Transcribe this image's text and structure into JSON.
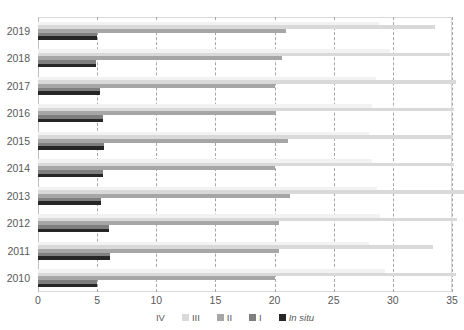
{
  "chart_data": {
    "type": "bar",
    "orientation": "horizontal",
    "title": "",
    "subtitle": "",
    "xlabel": "",
    "ylabel": "",
    "xlim": [
      0,
      35
    ],
    "ylim": null,
    "grid": true,
    "grid_axis": "x",
    "legend_position": "bottom",
    "categories": [
      "2019",
      "2018",
      "2017",
      "2016",
      "2015",
      "2014",
      "2013",
      "2012",
      "2011",
      "2010"
    ],
    "xticks": [
      0,
      5,
      10,
      15,
      20,
      25,
      30,
      35
    ],
    "xtick_labels": [
      "0",
      "5",
      "10",
      "15",
      "20",
      "25",
      "30",
      "35"
    ],
    "series": [
      {
        "name": "IV",
        "color": "#f2f2f2",
        "values": [
          28.8,
          29.8,
          28.6,
          28.2,
          28.0,
          28.2,
          28.7,
          28.9,
          28.0,
          29.3
        ]
      },
      {
        "name": "III",
        "color": "#d9d9d9",
        "values": [
          33.6,
          34.8,
          35.3,
          35.2,
          35.1,
          35.2,
          36.0,
          35.4,
          33.4,
          35.3
        ]
      },
      {
        "name": "II",
        "color": "#a6a6a6",
        "values": [
          21.0,
          20.6,
          20.0,
          20.1,
          21.1,
          20.0,
          21.3,
          20.4,
          20.4,
          20.0
        ]
      },
      {
        "name": "I",
        "color": "#7f7f7f",
        "values": [
          5.0,
          4.9,
          5.2,
          5.5,
          5.6,
          5.5,
          5.3,
          6.0,
          6.1,
          5.0
        ]
      },
      {
        "name": "In situ",
        "color": "#262626",
        "values": [
          5.0,
          4.9,
          5.2,
          5.5,
          5.6,
          5.5,
          5.3,
          6.0,
          6.1,
          5.0
        ]
      }
    ]
  },
  "legend": {
    "items": [
      {
        "label": "IV",
        "color": "#f2f2f2",
        "italic": false
      },
      {
        "label": "III",
        "color": "#d9d9d9",
        "italic": false
      },
      {
        "label": "II",
        "color": "#a6a6a6",
        "italic": false
      },
      {
        "label": "I",
        "color": "#7f7f7f",
        "italic": false
      },
      {
        "label": "In situ",
        "color": "#262626",
        "italic": true
      }
    ]
  },
  "colors": {
    "grid": "#a6a6a6",
    "frame": "#d9d9d9",
    "text": "#595959",
    "background": "#ffffff"
  }
}
